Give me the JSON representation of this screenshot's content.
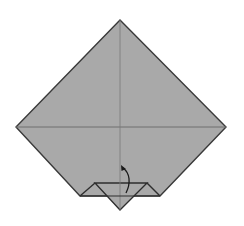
{
  "diagram": {
    "type": "origami-step",
    "colors": {
      "background": "#ffffff",
      "paper": "#a9a9a9",
      "edge": "#3a3a3a",
      "crease": "#6e6e6e",
      "arrow": "#1a1a1a"
    },
    "points": {
      "top": [
        120,
        20
      ],
      "left": [
        16,
        127
      ],
      "right": [
        226,
        127
      ],
      "bottom_left_cut": [
        80,
        196
      ],
      "bottom_right_cut": [
        160,
        196
      ],
      "inner_left": [
        95,
        183
      ],
      "inner_right": [
        147,
        183
      ],
      "tip": [
        120,
        210
      ]
    },
    "arrow": {
      "label": "fold-up",
      "from": [
        126,
        193
      ],
      "to": [
        123,
        167
      ]
    }
  }
}
